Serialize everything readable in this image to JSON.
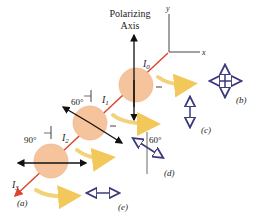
{
  "axis_label_line1": "Polarizing",
  "axis_label_line2": "Axis",
  "coords": {
    "y": "y",
    "x": "x"
  },
  "intensities": {
    "I0": "I",
    "I0_sub": "0",
    "I1": "I",
    "I1_sub": "1",
    "I2": "I",
    "I2_sub": "2",
    "I3": "I",
    "I3_sub": "3"
  },
  "angles": {
    "a1": "60°",
    "a2": "90°",
    "a3": "60°"
  },
  "panels": {
    "a": "(a)",
    "b": "(b)",
    "c": "(c)",
    "d": "(d)",
    "e": "(e)"
  },
  "colors": {
    "polarizer": "#f6c49c",
    "beam": "#e0452b",
    "axis_arrow": "#111111",
    "pol_arrow": "#3b3a7a",
    "swoosh": "#f2d27a"
  }
}
